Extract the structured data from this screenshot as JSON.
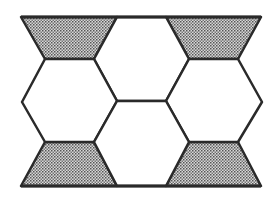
{
  "figure": {
    "stroke_color": "#2a2a2a",
    "fill_white": "#ffffff",
    "shade_color": "#b8b8b8",
    "dot_color": "#555555",
    "shapes": {
      "trapezoid_top_left": "21,17 117,17 94,59 45,59",
      "trapezoid_top_right": "166,17 261,17 238,59 189,59",
      "trapezoid_bottom_left": "45,142 94,142 117,186 21,186",
      "trapezoid_bottom_right": "189,142 238,142 261,186 166,186",
      "hex_top_center": "117,17 166,17 189,59 166,101 117,101 94,59",
      "hex_left": "45,59 94,59 117,101 94,142 45,142 22,102",
      "hex_right": "189,59 238,59 262,102 238,142 189,142 166,101",
      "hex_bottom_center": "117,101 166,101 189,142 166,186 117,186 94,142",
      "outer_rect": "21,17 261,17 262,102 261,186 21,186 22,102"
    }
  }
}
